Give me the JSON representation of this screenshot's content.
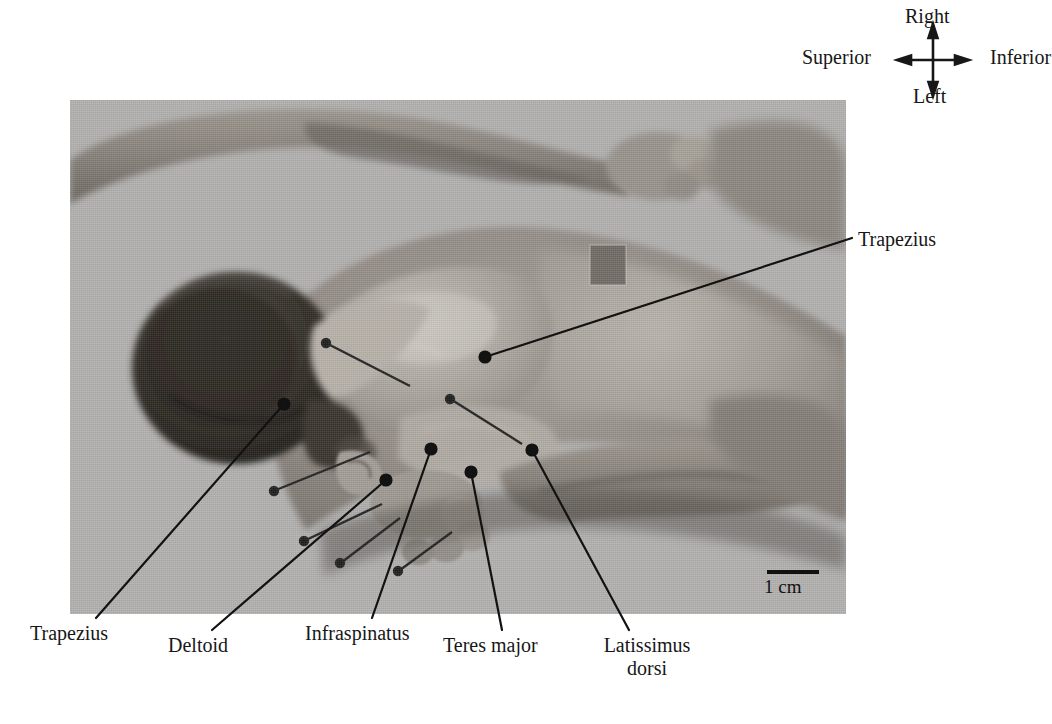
{
  "figure": {
    "kind": "anatomical-dissection-photograph",
    "background_color": "#b5b5b5",
    "page_background": "#ffffff",
    "ink_color": "#171717"
  },
  "compass": {
    "name": "orientation-compass",
    "up": "Right",
    "down": "Left",
    "left": "Superior",
    "right": "Inferior"
  },
  "scale": {
    "label": "1 cm",
    "bar_color": "#111111"
  },
  "callouts": [
    {
      "id": "trapezius-right",
      "label": "Trapezius",
      "anchor_x": 485,
      "anchor_y": 357,
      "text_x": 858,
      "text_y": 240
    },
    {
      "id": "trapezius-left",
      "label": "Trapezius",
      "anchor_x": 284,
      "anchor_y": 404,
      "text_x": 100,
      "text_y": 632
    },
    {
      "id": "deltoid",
      "label": "Deltoid",
      "anchor_x": 386,
      "anchor_y": 480,
      "text_x": 213,
      "text_y": 645
    },
    {
      "id": "infraspinatus",
      "label": "Infraspinatus",
      "anchor_x": 431,
      "anchor_y": 449,
      "text_x": 372,
      "text_y": 632
    },
    {
      "id": "teres-major",
      "label": "Teres major",
      "anchor_x": 471,
      "anchor_y": 472,
      "text_x": 503,
      "text_y": 645
    },
    {
      "id": "latissimus",
      "label": "Latissimus dorsi",
      "line1": "Latissimus",
      "line2": "dorsi",
      "anchor_x": 532,
      "anchor_y": 450,
      "text_x": 630,
      "text_y": 645
    }
  ]
}
